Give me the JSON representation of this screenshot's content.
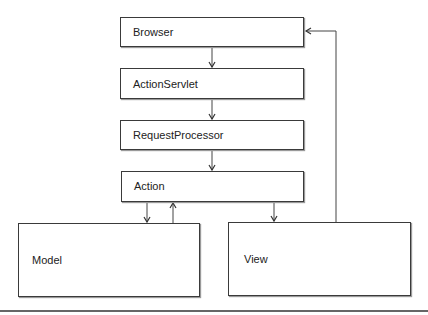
{
  "diagram": {
    "nodes": [
      {
        "id": "browser",
        "label": "Browser"
      },
      {
        "id": "action-servlet",
        "label": "ActionServlet"
      },
      {
        "id": "request-processor",
        "label": "RequestProcessor"
      },
      {
        "id": "action",
        "label": "Action"
      },
      {
        "id": "model",
        "label": "Model"
      },
      {
        "id": "view",
        "label": "View"
      }
    ],
    "edges": [
      {
        "from": "browser",
        "to": "action-servlet"
      },
      {
        "from": "action-servlet",
        "to": "request-processor"
      },
      {
        "from": "request-processor",
        "to": "action"
      },
      {
        "from": "action",
        "to": "model"
      },
      {
        "from": "model",
        "to": "action"
      },
      {
        "from": "action",
        "to": "view"
      },
      {
        "from": "view",
        "to": "browser"
      }
    ]
  }
}
